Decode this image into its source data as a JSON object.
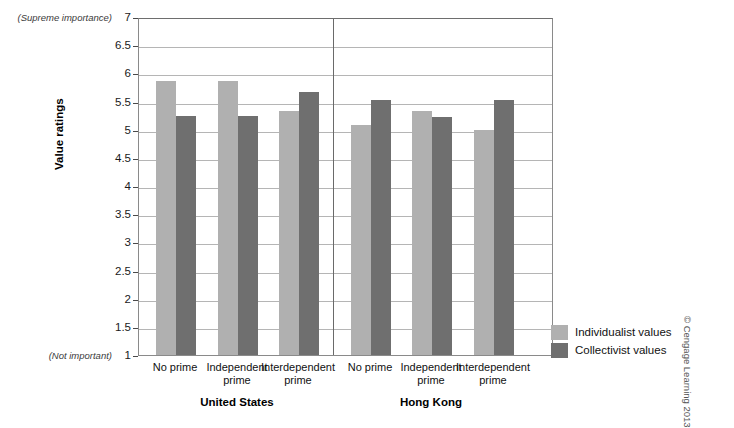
{
  "chart_data": {
    "type": "bar",
    "title": "",
    "xlabel": "",
    "ylabel": "Value ratings",
    "ylim": [
      1,
      7
    ],
    "ytick_step": 0.5,
    "yticks": [
      "7",
      "6.5",
      "6",
      "5.5",
      "5",
      "4.5",
      "4",
      "3.5",
      "3",
      "2.5",
      "2",
      "1.5",
      "1"
    ],
    "y_axis_high_note": "(Supreme importance)",
    "y_axis_low_note": "(Not important)",
    "grid": true,
    "legend_position": "right",
    "panels": [
      {
        "name": "United States",
        "categories": [
          "No prime",
          "Independent\nprime",
          "Interdependent\nprime"
        ]
      },
      {
        "name": "Hong Kong",
        "categories": [
          "No prime",
          "Independent\nprime",
          "Interdependent\nprime"
        ]
      }
    ],
    "categories": [
      "United States / No prime",
      "United States / Independent prime",
      "United States / Interdependent prime",
      "Hong Kong / No prime",
      "Hong Kong / Independent prime",
      "Hong Kong / Interdependent prime"
    ],
    "series": [
      {
        "name": "Individualist values",
        "color": "#b0b0b0",
        "values": [
          5.87,
          5.87,
          5.33,
          5.08,
          5.33,
          5.0
        ]
      },
      {
        "name": "Collectivist values",
        "color": "#6f6f6f",
        "values": [
          5.25,
          5.25,
          5.67,
          5.52,
          5.22,
          5.53
        ]
      }
    ]
  },
  "legend": {
    "items": [
      {
        "label": "Individualist values",
        "color": "#b0b0b0"
      },
      {
        "label": "Collectivist values",
        "color": "#6f6f6f"
      }
    ]
  },
  "credit": "© Cengage Learning 2013"
}
